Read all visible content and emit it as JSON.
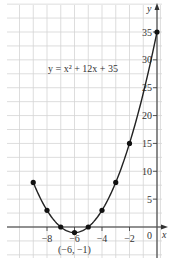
{
  "chart_data": {
    "type": "line",
    "title": "",
    "equation_label": "y = x² + 12x + 35",
    "xlabel": "x",
    "ylabel": "y",
    "xlim": [
      -10.5,
      0.3
    ],
    "ylim": [
      -4.5,
      37.5
    ],
    "x_ticks": [
      -8,
      -6,
      -4,
      -2
    ],
    "x_tick_labels": [
      "−8",
      "−6",
      "−4",
      "−2"
    ],
    "origin_label": "0",
    "y_ticks": [
      5,
      10,
      15,
      20,
      25,
      30,
      35
    ],
    "y_tick_labels": [
      "5",
      "10",
      "15",
      "20",
      "25",
      "30",
      "35"
    ],
    "grid": true,
    "series": [
      {
        "name": "y = x² + 12x + 35",
        "points": [
          {
            "x": -9,
            "y": 8
          },
          {
            "x": -8,
            "y": 3
          },
          {
            "x": -7,
            "y": 0
          },
          {
            "x": -6,
            "y": -1
          },
          {
            "x": -5,
            "y": 0
          },
          {
            "x": -4,
            "y": 3
          },
          {
            "x": -3,
            "y": 8
          },
          {
            "x": -2,
            "y": 15
          },
          {
            "x": 0,
            "y": 35
          }
        ]
      }
    ],
    "annotations": [
      {
        "text": "(−6, −1)",
        "x": -6,
        "y": -1,
        "label": "vertex"
      }
    ]
  }
}
